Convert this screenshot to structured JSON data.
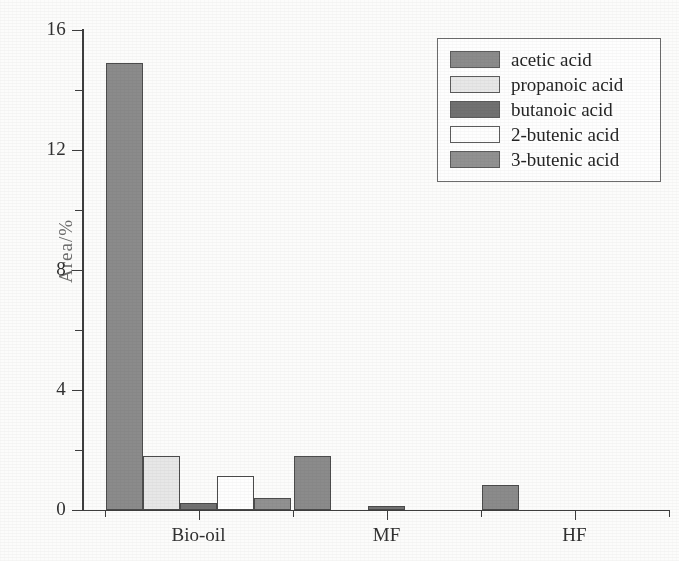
{
  "chart_data": {
    "type": "bar",
    "title": "",
    "xlabel": "",
    "ylabel": "Area/%",
    "categories": [
      "Bio-oil",
      "MF",
      "HF"
    ],
    "series": [
      {
        "name": "acetic acid",
        "color": "#8a8a8a",
        "values": [
          14.9,
          1.8,
          0.85
        ]
      },
      {
        "name": "propanoic acid",
        "color": "#e8e8e8",
        "values": [
          1.8,
          0,
          0
        ]
      },
      {
        "name": "butanoic acid",
        "color": "#6f6f6f",
        "values": [
          0.25,
          0.15,
          0
        ]
      },
      {
        "name": "2-butenic acid",
        "color": "#ffffff",
        "values": [
          1.15,
          0,
          0
        ]
      },
      {
        "name": "3-butenic acid",
        "color": "#909090",
        "values": [
          0.4,
          0,
          0
        ]
      }
    ],
    "ylim": [
      0,
      16
    ],
    "yticks": [
      0,
      4,
      8,
      12,
      16
    ],
    "yticklabels": [
      "0",
      "4",
      "8",
      "12",
      "16"
    ],
    "yminorticks": [
      2,
      6,
      10,
      14
    ],
    "grid": false,
    "legend_position": "top-right"
  },
  "axes": {
    "y_title": "Area/%",
    "x_tick_labels": [
      "Bio-oil",
      "MF",
      "HF"
    ]
  },
  "legend": {
    "entries": [
      {
        "label": "acetic acid",
        "swatch": "#8a8a8a"
      },
      {
        "label": "propanoic acid",
        "swatch": "#e8e8e8"
      },
      {
        "label": "butanoic acid",
        "swatch": "#6f6f6f"
      },
      {
        "label": "2-butenic acid",
        "swatch": "#ffffff"
      },
      {
        "label": "3-butenic acid",
        "swatch": "#909090"
      }
    ]
  }
}
